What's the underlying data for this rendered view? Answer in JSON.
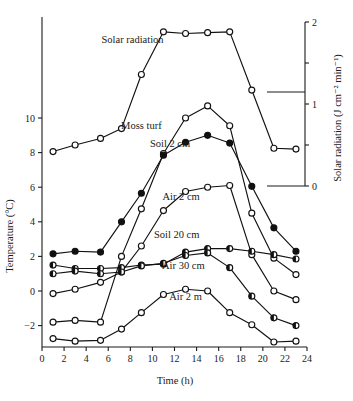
{
  "chart_data": {
    "type": "line",
    "title": "",
    "xlabel": "Time (h)",
    "ylabel": "Temperature (°C)",
    "y2label": "Solar radiation (J cm⁻² min⁻¹)",
    "xlim": [
      0,
      24
    ],
    "ylim": [
      -3.2,
      11.6
    ],
    "y2lim": [
      0,
      2
    ],
    "grid": false,
    "legend_position": "inline-annotations",
    "xticks": [
      0,
      2,
      4,
      6,
      8,
      10,
      12,
      14,
      16,
      18,
      20,
      22,
      24
    ],
    "xticklabels": [
      "0",
      "2",
      "4",
      "6",
      "8",
      "10",
      "12",
      "14",
      "16",
      "18",
      "20",
      "22",
      "24"
    ],
    "yticks": [
      -2,
      0,
      2,
      4,
      6,
      8,
      10
    ],
    "yticklabels": [
      "−2",
      "0",
      "2",
      "4",
      "6",
      "8",
      "10"
    ],
    "y2ticks": [
      0,
      0.5,
      1,
      1.5,
      2
    ],
    "y2ticklabels": [
      "0",
      "",
      "1",
      "",
      "2"
    ],
    "x": [
      1,
      3,
      5.3,
      7.2,
      9,
      11,
      13,
      15,
      17,
      19,
      21,
      23
    ],
    "series": [
      {
        "name": "Solar radiation",
        "axis": "right",
        "marker": "open-circle",
        "label_x": 8.2,
        "label_y_value": 1.74,
        "values": [
          0.42,
          0.5,
          0.58,
          0.7,
          1.36,
          1.88,
          1.86,
          1.87,
          1.88,
          1.17,
          0.46,
          0.45
        ]
      },
      {
        "name": "Moss turf",
        "axis": "left",
        "marker": "open-circle",
        "label_x": 9.0,
        "label_y_value": 9.35,
        "values": [
          -1.8,
          -1.7,
          -1.8,
          2.0,
          4.75,
          7.95,
          10.0,
          10.7,
          9.55,
          4.5,
          1.9,
          0.95
        ]
      },
      {
        "name": "Soil 2 cm",
        "axis": "left",
        "marker": "filled-circle",
        "label_x": 11.6,
        "label_y_value": 8.3,
        "values": [
          2.15,
          2.3,
          2.25,
          4.0,
          5.65,
          7.85,
          8.6,
          9.0,
          8.55,
          6.05,
          3.65,
          2.3
        ]
      },
      {
        "name": "Air 2 cm",
        "axis": "left",
        "marker": "open-circle",
        "label_x": 12.6,
        "label_y_value": 5.25,
        "values": [
          -0.15,
          0.1,
          0.5,
          1.1,
          2.6,
          4.65,
          5.75,
          6.0,
          6.1,
          2.1,
          0.0,
          -0.5
        ]
      },
      {
        "name": "Soil 20 cm",
        "axis": "left",
        "marker": "half-filled-circle",
        "label_x": 12.2,
        "label_y_value": 3.05,
        "values": [
          1.5,
          1.3,
          1.3,
          1.35,
          1.5,
          1.55,
          2.25,
          2.45,
          2.45,
          2.3,
          2.1,
          1.85
        ]
      },
      {
        "name": "Air 30 cm",
        "axis": "left",
        "marker": "half-filled-circle",
        "label_x": 12.8,
        "label_y_value": 1.25,
        "values": [
          1.0,
          1.15,
          1.0,
          1.1,
          1.45,
          1.6,
          2.05,
          2.2,
          1.35,
          -0.3,
          -1.55,
          -2.0
        ]
      },
      {
        "name": "Air 2 m",
        "axis": "left",
        "marker": "open-circle",
        "label_x": 13.0,
        "label_y_value": -0.5,
        "values": [
          -2.75,
          -2.9,
          -2.85,
          -2.2,
          -1.25,
          -0.2,
          0.1,
          0.0,
          -1.25,
          -1.95,
          -2.95,
          -2.9
        ]
      }
    ]
  }
}
